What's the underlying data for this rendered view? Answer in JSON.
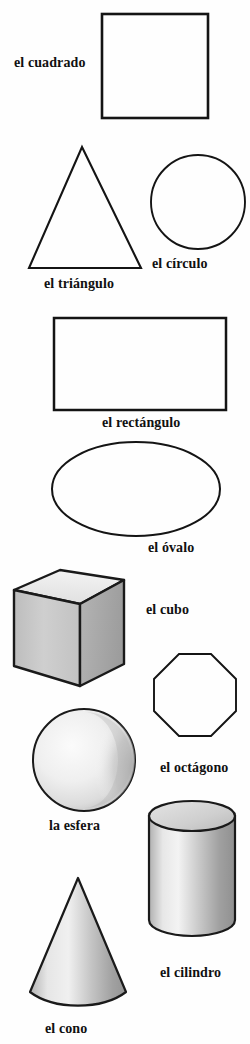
{
  "page": {
    "language": "es",
    "background_color": "#fefefe",
    "ink_color": "#141414"
  },
  "figures": [
    {
      "id": "square",
      "label": "el cuadrado",
      "shape": "square",
      "dimension": "2D",
      "filled": false,
      "shaded": false
    },
    {
      "id": "triangle",
      "label": "el triángulo",
      "shape": "triangle",
      "dimension": "2D",
      "filled": false,
      "shaded": false
    },
    {
      "id": "circle",
      "label": "el círculo",
      "shape": "circle",
      "dimension": "2D",
      "filled": false,
      "shaded": false
    },
    {
      "id": "rectangle",
      "label": "el rectángulo",
      "shape": "rectangle",
      "dimension": "2D",
      "filled": false,
      "shaded": false
    },
    {
      "id": "oval",
      "label": "el óvalo",
      "shape": "ellipse",
      "dimension": "2D",
      "filled": false,
      "shaded": false
    },
    {
      "id": "cube",
      "label": "el cubo",
      "shape": "cube",
      "dimension": "3D",
      "filled": true,
      "shaded": true,
      "face_colors": {
        "top": "#e9e9e9",
        "left": "#c9c9c9",
        "right": "#a8a8a8"
      }
    },
    {
      "id": "octagon",
      "label": "el octágono",
      "shape": "octagon",
      "dimension": "2D",
      "filled": false,
      "shaded": false
    },
    {
      "id": "sphere",
      "label": "la esfera",
      "shape": "sphere",
      "dimension": "3D",
      "filled": true,
      "shaded": true,
      "face_colors": {
        "highlight": "#f4f4f4",
        "shadow": "#b9b9b9"
      }
    },
    {
      "id": "cylinder",
      "label": "el cilindro",
      "shape": "cylinder",
      "dimension": "3D",
      "filled": true,
      "shaded": true,
      "face_colors": {
        "top": "#d6d6d6",
        "body_light": "#ededed",
        "body_dark": "#9f9f9f"
      }
    },
    {
      "id": "cone",
      "label": "el cono",
      "shape": "cone",
      "dimension": "3D",
      "filled": true,
      "shaded": true,
      "face_colors": {
        "light": "#e4e4e4",
        "dark": "#9c9c9c"
      }
    }
  ]
}
